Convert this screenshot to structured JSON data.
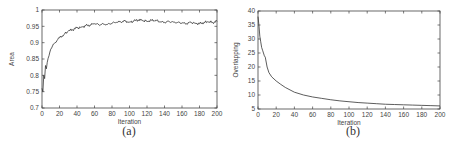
{
  "chart_data": [
    {
      "type": "line",
      "caption": "(a)",
      "title": "",
      "xlabel": "Iteration",
      "ylabel": "Area",
      "xlim": [
        0,
        200
      ],
      "ylim": [
        0.7,
        1.0
      ],
      "xticks": [
        0,
        20,
        40,
        60,
        80,
        100,
        120,
        140,
        160,
        180,
        200
      ],
      "yticks": [
        0.7,
        0.75,
        0.8,
        0.85,
        0.9,
        0.95,
        1
      ],
      "ytick_labels": [
        "0.7",
        "0.75",
        "0.8",
        "0.85",
        "0.9",
        "0.95",
        "1"
      ],
      "grid": false,
      "legend": null,
      "series": [
        {
          "name": "Area",
          "color": "#333333",
          "x": [
            0,
            1,
            2,
            3,
            4,
            5,
            6,
            8,
            10,
            12,
            15,
            18,
            20,
            25,
            30,
            35,
            40,
            45,
            50,
            55,
            60,
            65,
            70,
            75,
            80,
            85,
            90,
            95,
            100,
            105,
            110,
            115,
            120,
            125,
            130,
            135,
            140,
            145,
            150,
            155,
            160,
            165,
            170,
            175,
            180,
            185,
            190,
            195,
            200
          ],
          "y": [
            0.76,
            0.75,
            0.8,
            0.79,
            0.83,
            0.82,
            0.84,
            0.86,
            0.88,
            0.89,
            0.9,
            0.91,
            0.915,
            0.925,
            0.935,
            0.94,
            0.945,
            0.948,
            0.952,
            0.954,
            0.958,
            0.955,
            0.957,
            0.956,
            0.96,
            0.962,
            0.964,
            0.966,
            0.963,
            0.966,
            0.97,
            0.967,
            0.966,
            0.968,
            0.969,
            0.963,
            0.962,
            0.965,
            0.963,
            0.962,
            0.96,
            0.958,
            0.962,
            0.96,
            0.958,
            0.962,
            0.963,
            0.962,
            0.965
          ]
        }
      ]
    },
    {
      "type": "line",
      "caption": "(b)",
      "title": "",
      "xlabel": "Iteration",
      "ylabel": "Overlapping",
      "xlim": [
        0,
        200
      ],
      "ylim": [
        5,
        40
      ],
      "xticks": [
        0,
        20,
        40,
        60,
        80,
        100,
        120,
        140,
        160,
        180,
        200
      ],
      "yticks": [
        5,
        10,
        15,
        20,
        25,
        30,
        35,
        40
      ],
      "ytick_labels": [
        "5",
        "10",
        "15",
        "20",
        "25",
        "30",
        "35",
        "40"
      ],
      "grid": false,
      "legend": null,
      "series": [
        {
          "name": "Overlapping",
          "color": "#333333",
          "x": [
            0,
            1,
            2,
            3,
            4,
            5,
            6,
            7,
            8,
            10,
            12,
            15,
            20,
            25,
            30,
            40,
            50,
            60,
            70,
            80,
            90,
            100,
            110,
            120,
            130,
            140,
            150,
            160,
            170,
            180,
            190,
            200
          ],
          "y": [
            38,
            35,
            31,
            29,
            27,
            26,
            25,
            24,
            23.5,
            20,
            18,
            16.5,
            15,
            13.8,
            12.7,
            11,
            10,
            9.3,
            8.8,
            8.3,
            7.9,
            7.6,
            7.3,
            7.1,
            6.9,
            6.7,
            6.6,
            6.5,
            6.4,
            6.3,
            6.2,
            6.1
          ]
        }
      ]
    }
  ]
}
